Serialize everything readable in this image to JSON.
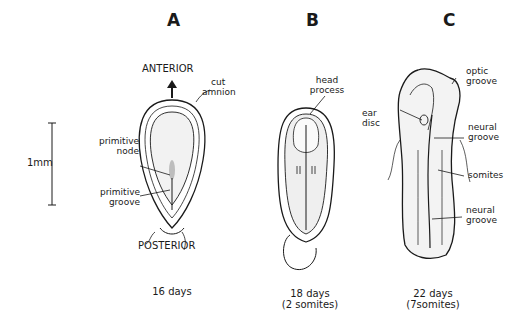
{
  "panels": [
    {
      "letter": "A",
      "caption_line1": "16 days",
      "caption_line2": "",
      "orientation": {
        "top": "ANTERIOR",
        "bottom": "POSTERIOR"
      },
      "labels": {
        "cut_amnion_1": "cut",
        "cut_amnion_2": "amnion",
        "primitive_node_1": "primitive",
        "primitive_node_2": "node",
        "primitive_groove_1": "primitive",
        "primitive_groove_2": "groove"
      }
    },
    {
      "letter": "B",
      "caption_line1": "18 days",
      "caption_line2": "(2 somites)",
      "labels": {
        "head_process_1": "head",
        "head_process_2": "process"
      }
    },
    {
      "letter": "C",
      "caption_line1": "22 days",
      "caption_line2": "(7somites)",
      "labels": {
        "optic_groove_1": "optic",
        "optic_groove_2": "groove",
        "ear_disc_1": "ear",
        "ear_disc_2": "disc",
        "neural_groove_upper_1": "neural",
        "neural_groove_upper_2": "groove",
        "somites": "somites",
        "neural_groove_lower_1": "neural",
        "neural_groove_lower_2": "groove"
      }
    }
  ],
  "scale_bar": {
    "label": "1mm"
  },
  "colors": {
    "ink": "#1a1a1a",
    "stipple": "#9a9a9a",
    "background": "#ffffff"
  }
}
